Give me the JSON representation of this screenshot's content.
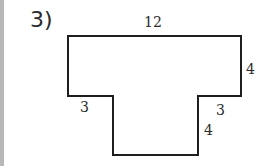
{
  "problem": {
    "number_label": "3)"
  },
  "figure": {
    "shape": "T-shaped polygon",
    "stroke_color": "#1e1e1e",
    "dimensions": {
      "top": "12",
      "right_side": "4",
      "bottom_left_ledge": "3",
      "bottom_right_ledge": "3",
      "stem_height": "4"
    }
  }
}
